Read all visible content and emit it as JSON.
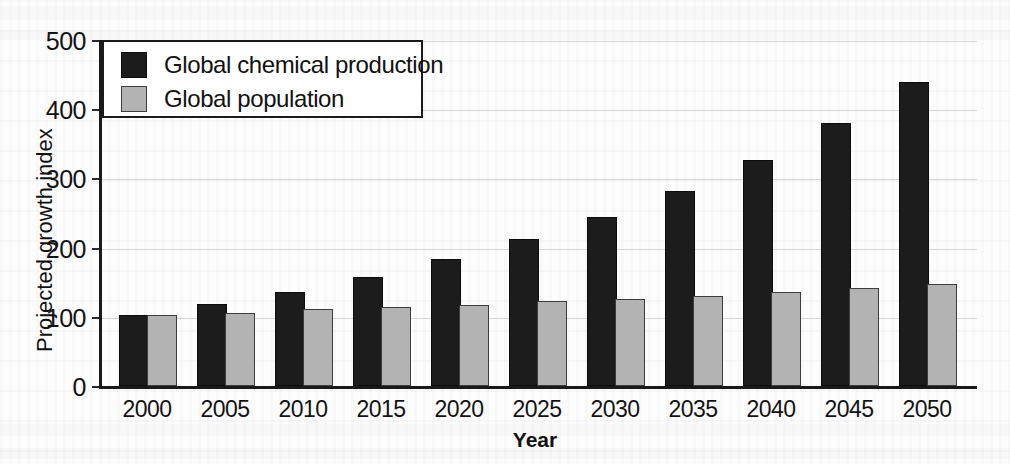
{
  "chart_data": {
    "type": "bar",
    "title": "",
    "xlabel": "Year",
    "ylabel": "Projected growth index",
    "categories": [
      "2000",
      "2005",
      "2010",
      "2015",
      "2020",
      "2025",
      "2030",
      "2035",
      "2040",
      "2045",
      "2050"
    ],
    "series": [
      {
        "name": "Global chemical production",
        "color": "#1c1c1c",
        "values": [
          100,
          116,
          133,
          155,
          181,
          210,
          242,
          280,
          325,
          378,
          437
        ]
      },
      {
        "name": "Global population",
        "color": "#b3b3b3",
        "values": [
          100,
          103,
          108,
          111,
          115,
          120,
          123,
          128,
          134,
          139,
          145
        ]
      }
    ],
    "ylim": [
      0,
      500
    ],
    "yticks": [
      0,
      100,
      200,
      300,
      400,
      500
    ],
    "ytick_labels": [
      "0",
      "100",
      "200",
      "300",
      "400",
      "500"
    ],
    "grid": true,
    "legend_position": "upper left"
  },
  "legend": {
    "entries": [
      {
        "label": "Global chemical production",
        "swatch": "black-square-icon"
      },
      {
        "label": "Global population",
        "swatch": "gray-square-icon"
      }
    ]
  }
}
